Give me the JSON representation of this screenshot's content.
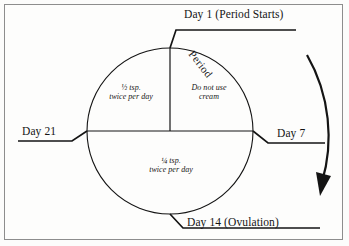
{
  "page": {
    "background_color": "#fcfcfb",
    "border_color": "#8d8d8d",
    "ink_color": "#141414"
  },
  "diagram": {
    "type": "cycle-wheel",
    "circle": {
      "cx": 170,
      "cy": 131,
      "r": 83
    },
    "direction": "clockwise",
    "day_labels": [
      {
        "id": "day1",
        "text": "Day 1 (Period Starts)",
        "position": "top"
      },
      {
        "id": "day7",
        "text": "Day 7",
        "position": "right"
      },
      {
        "id": "day14",
        "text": "Day 14 (Ovulation)",
        "position": "bottom"
      },
      {
        "id": "day21",
        "text": "Day 21",
        "position": "left"
      }
    ],
    "arc_label": {
      "id": "period",
      "text": "Period",
      "position": "upper-right-arc"
    },
    "sectors": [
      {
        "id": "upper-left",
        "span": "Day 21 to Day 1",
        "line1": "½ tsp.",
        "line2": "twice per day"
      },
      {
        "id": "upper-right",
        "span": "Day 1 to Day 7",
        "line1": "Do not use",
        "line2": "cream"
      },
      {
        "id": "bottom",
        "span": "Day 7 to Day 21",
        "line1": "¼ tsp.",
        "line2": "twice per day"
      }
    ],
    "direction_arrow": {
      "id": "clockwise-arrow",
      "description": "curved arrow pointing downward on the right side"
    }
  }
}
